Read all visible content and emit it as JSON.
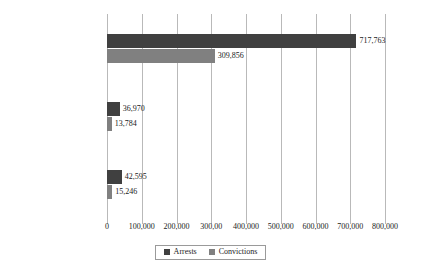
{
  "chart_data": {
    "type": "bar",
    "orientation": "horizontal",
    "title": "",
    "xlabel": "",
    "ylabel": "",
    "categories": [
      "Native-Born Americans",
      "Unauthorized Immigrants",
      "Legal Immigrants"
    ],
    "series": [
      {
        "name": "Arrests",
        "color": "#404040",
        "values": [
          717763,
          36970,
          42595
        ],
        "value_labels": [
          "717,763",
          "36,970",
          "42,595"
        ]
      },
      {
        "name": "Convictions",
        "color": "#808080",
        "values": [
          309856,
          13784,
          15246
        ],
        "value_labels": [
          "309,856",
          "13,784",
          "15,246"
        ]
      }
    ],
    "xlim": [
      0,
      800000
    ],
    "xticks": [
      0,
      100000,
      200000,
      300000,
      400000,
      500000,
      600000,
      700000,
      800000
    ],
    "xtick_labels": [
      "0",
      "100,000",
      "200,000",
      "300,00",
      "400,000",
      "500,000",
      "600,000",
      "700,000",
      "800,000"
    ],
    "grid": "vertical",
    "legend_position": "bottom-center"
  },
  "legend": {
    "items": [
      {
        "label": "Arrests",
        "color": "#404040"
      },
      {
        "label": "Convictions",
        "color": "#808080"
      }
    ]
  }
}
